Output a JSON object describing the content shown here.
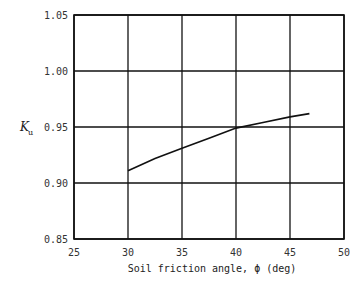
{
  "chart_data": {
    "type": "line",
    "title": "",
    "xlabel": "Soil friction angle, ϕ (deg)",
    "ylabel": "K",
    "ylabel_subscript": "u",
    "xlim": [
      25,
      50
    ],
    "ylim": [
      0.85,
      1.05
    ],
    "xticks": [
      "25",
      "30",
      "35",
      "40",
      "45",
      "50"
    ],
    "yticks": [
      "0.85",
      "0.90",
      "0.95",
      "1.00",
      "1.05"
    ],
    "grid": true,
    "legend": null,
    "series": [
      {
        "name": "K_u",
        "x": [
          30,
          32.5,
          35,
          37.5,
          40,
          42.5,
          45,
          46.8
        ],
        "y": [
          0.911,
          0.922,
          0.931,
          0.94,
          0.949,
          0.954,
          0.959,
          0.962
        ]
      }
    ]
  }
}
